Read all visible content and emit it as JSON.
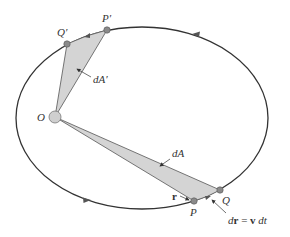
{
  "diagram": {
    "colors": {
      "orbit": "#333333",
      "sector_fill": "#d4d4d4",
      "sector_stroke": "#555555",
      "point_fill": "#8a8a8a",
      "focus_fill": "#cfcfcf",
      "label": "#333333"
    },
    "orbit": {
      "cx": 142,
      "cy": 118,
      "rx": 126,
      "ry": 91
    },
    "focus": {
      "label": "O",
      "x": 55,
      "y": 117,
      "r": 6
    },
    "points": [
      {
        "id": "P_prime",
        "label": "P′",
        "x": 107,
        "y": 30
      },
      {
        "id": "Q_prime",
        "label": "Q′",
        "x": 67,
        "y": 44
      },
      {
        "id": "Q",
        "label": "Q",
        "x": 220,
        "y": 190
      },
      {
        "id": "P",
        "label": "P",
        "x": 194,
        "y": 201
      }
    ],
    "labels": {
      "O": "O",
      "P_prime": "P′",
      "Q_prime": "Q′",
      "P": "P",
      "Q": "Q",
      "dA_prime": "dA′",
      "dA": "dA",
      "r": "r",
      "dr_d": "d",
      "dr_r": "r",
      "dr_eq": " = ",
      "dr_v": "v",
      "dr_dt": " dt"
    },
    "annotations": [
      {
        "text": "dA′",
        "points_to": "upper sector"
      },
      {
        "text": "dA",
        "points_to": "lower sector"
      },
      {
        "text": "r",
        "points_to": "radius vector to P"
      },
      {
        "text": "dr = v dt",
        "points_to": "arc P to Q"
      }
    ],
    "direction_arrows": [
      {
        "x": 196,
        "y": 35,
        "direction": "left"
      },
      {
        "x": 87,
        "y": 200,
        "direction": "right"
      }
    ]
  }
}
